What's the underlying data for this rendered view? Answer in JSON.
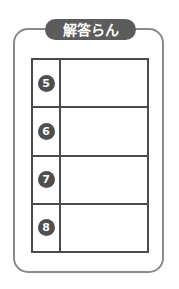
{
  "sheet": {
    "title": "解答らん",
    "frame_color": "#8a8a8a",
    "title_pill_color": "#5c5c5c",
    "title_text_color": "#ffffff",
    "table_border_color": "#4a4a4a",
    "badge_color": "#4f4f4f",
    "badge_text_color": "#ffffff",
    "background_color": "#ffffff"
  },
  "table": {
    "rows": [
      {
        "number": "5",
        "answer": ""
      },
      {
        "number": "6",
        "answer": ""
      },
      {
        "number": "7",
        "answer": ""
      },
      {
        "number": "8",
        "answer": ""
      }
    ]
  }
}
